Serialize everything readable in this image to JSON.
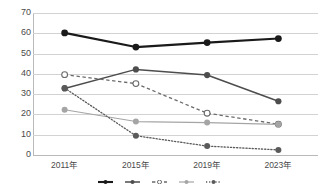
{
  "chart_data": {
    "type": "line",
    "title": "",
    "xlabel": "",
    "ylabel": "",
    "categories": [
      "2011年",
      "2015年",
      "2019年",
      "2023年"
    ],
    "x": [
      2011,
      2015,
      2019,
      2023
    ],
    "ylim": [
      0,
      70
    ],
    "ytick_values": [
      70,
      60,
      50,
      40,
      30,
      20,
      10,
      0
    ],
    "ytick_labels": [
      "70",
      "60",
      "50",
      "40",
      "30",
      "20",
      "10",
      "0"
    ],
    "grid": true,
    "legend_position": "bottom",
    "series": [
      {
        "name": "series-1",
        "label": "",
        "values": [
          60.2,
          53.2,
          55.4,
          57.4
        ],
        "color": "#1a1a1a",
        "line_style": "solid",
        "line_width": 2.1,
        "marker": "filled-circle",
        "marker_size": 3.4
      },
      {
        "name": "series-2",
        "label": "",
        "values": [
          32.8,
          42.2,
          39.4,
          26.5
        ],
        "color": "#4d4d4d",
        "line_style": "solid",
        "line_width": 1.5,
        "marker": "filled-circle",
        "marker_size": 3.1
      },
      {
        "name": "series-3",
        "label": "",
        "values": [
          39.6,
          35.2,
          20.6,
          15.2
        ],
        "color": "#6b6b6b",
        "line_style": "dashed",
        "line_width": 1.3,
        "marker": "open-circle",
        "marker_size": 2.9
      },
      {
        "name": "series-4",
        "label": "",
        "values": [
          22.3,
          16.5,
          16.0,
          15.1
        ],
        "color": "#a5a5a5",
        "line_style": "solid",
        "line_width": 1.2,
        "marker": "filled-circle",
        "marker_size": 3.0
      },
      {
        "name": "series-5",
        "label": "",
        "values": [
          33.0,
          9.5,
          4.4,
          2.5
        ],
        "color": "#5a5a5a",
        "line_style": "dotted",
        "line_width": 1.3,
        "marker": "filled-circle",
        "marker_size": 3.0
      }
    ]
  },
  "legend": {
    "entries": [
      {
        "label": "",
        "name": "legend-item-1"
      },
      {
        "label": "",
        "name": "legend-item-2"
      },
      {
        "label": "",
        "name": "legend-item-3"
      },
      {
        "label": "",
        "name": "legend-item-4"
      },
      {
        "label": "",
        "name": "legend-item-5"
      }
    ]
  },
  "colors": {
    "grid": "#d2d2d2",
    "axis": "#b9b9b9",
    "text": "#4a4a4a",
    "background": "#ffffff"
  }
}
